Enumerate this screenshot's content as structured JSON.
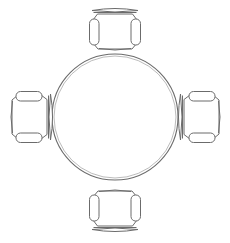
{
  "drawing": {
    "title": "Round Table With Four Armchairs",
    "view": "top-down floor plan",
    "style": "cad-line-drawing",
    "canvas": {
      "width": 230,
      "height": 243,
      "background_color": "#ffffff"
    },
    "colors": {
      "line": "#6b6b6b",
      "line_light": "#8d8d8d",
      "fill": "#ffffff"
    }
  },
  "table": {
    "name": "round-table",
    "shape": "circle",
    "center_x": 115,
    "center_y": 117,
    "radius": 63,
    "inner_radius": 61
  },
  "chairs": [
    {
      "id": "chair-north",
      "position": "north",
      "facing": "south",
      "rotation_deg": 0,
      "center_x": 115,
      "center_y": 31
    },
    {
      "id": "chair-east",
      "position": "east",
      "facing": "west",
      "rotation_deg": 270,
      "center_x": 201,
      "center_y": 117
    },
    {
      "id": "chair-south",
      "position": "south",
      "facing": "north",
      "rotation_deg": 180,
      "center_x": 115,
      "center_y": 209
    },
    {
      "id": "chair-west",
      "position": "west",
      "facing": "east",
      "rotation_deg": 90,
      "center_x": 30,
      "center_y": 117
    }
  ],
  "chair_parts": {
    "seat_label": "seat-body",
    "armrest_left_label": "armrest-left",
    "armrest_right_label": "armrest-right",
    "backrest_label": "backrest"
  }
}
